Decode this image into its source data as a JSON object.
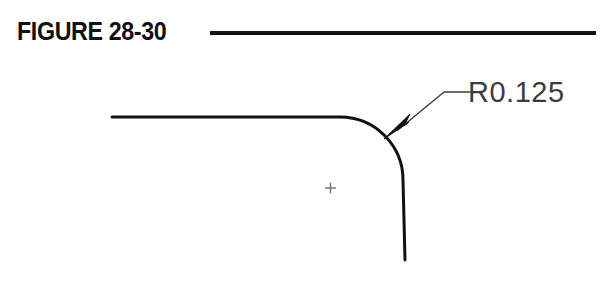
{
  "figure": {
    "title": "FIGURE 28-30",
    "rule_color": "#111111",
    "background_color": "#ffffff"
  },
  "drawing": {
    "name": "filleted-corner-profile",
    "outline_color": "#111111",
    "outline_width_px": 3,
    "annotation_color": "#3c3c3c",
    "center_mark_color": "#6e6e6e",
    "geometry": {
      "horizontal_edge": {
        "x1": 112,
        "y1": 117,
        "x2": 340,
        "y2": 117
      },
      "fillet_arc": {
        "center_x": 340,
        "center_y": 180,
        "radius": 63,
        "start_angle_deg": 270,
        "end_angle_deg": 360
      },
      "vertical_edge": {
        "x1": 403,
        "y1": 180,
        "x2": 405,
        "y2": 260
      },
      "center_mark": {
        "x": 330,
        "y": 188,
        "size": 11
      }
    },
    "leader": {
      "arrow_tip_x": 384,
      "arrow_tip_y": 139,
      "elbow_x": 444,
      "elbow_y": 92,
      "shelf_end_x": 470,
      "shelf_end_y": 92
    }
  },
  "annotations": {
    "radius_callout": "R0.125"
  }
}
